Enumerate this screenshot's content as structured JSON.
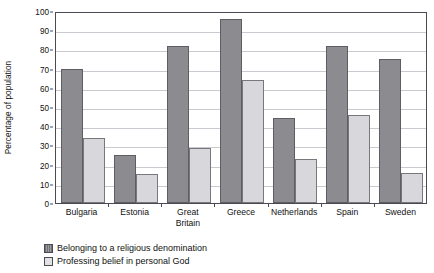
{
  "chart_data": {
    "type": "bar",
    "title": "",
    "xlabel": "",
    "ylabel": "Percentage of population",
    "ylim": [
      0,
      100
    ],
    "ytick_step": 10,
    "yticks": [
      0,
      10,
      20,
      30,
      40,
      50,
      60,
      70,
      80,
      90,
      100
    ],
    "grid": true,
    "legend_position": "below-left",
    "categories": [
      "Bulgaria",
      "Estonia",
      "Great\nBritain",
      "Greece",
      "Netherlands",
      "Spain",
      "Sweden"
    ],
    "series": [
      {
        "name": "Belonging to a religious denomination",
        "color": "#8b8b90",
        "values": [
          70,
          25,
          82,
          96,
          44.5,
          82,
          75
        ]
      },
      {
        "name": "Professing belief in personal God",
        "color": "#d8d8dc",
        "values": [
          34,
          15,
          28.5,
          64,
          23,
          46,
          15.5
        ]
      }
    ]
  },
  "axis": {
    "y_title": "Percentage of population"
  },
  "legend": {
    "items": [
      {
        "label": "Belonging to a religious denomination",
        "swatch": "dark-hatched-swatch"
      },
      {
        "label": "Professing belief in personal God",
        "swatch": "light-swatch"
      }
    ]
  },
  "colors": {
    "series1": "#8b8b90",
    "series2": "#d8d8dc",
    "gridline": "#c9c9cf",
    "frame": "#4a4a52",
    "text": "#111111",
    "background": "#ffffff"
  }
}
